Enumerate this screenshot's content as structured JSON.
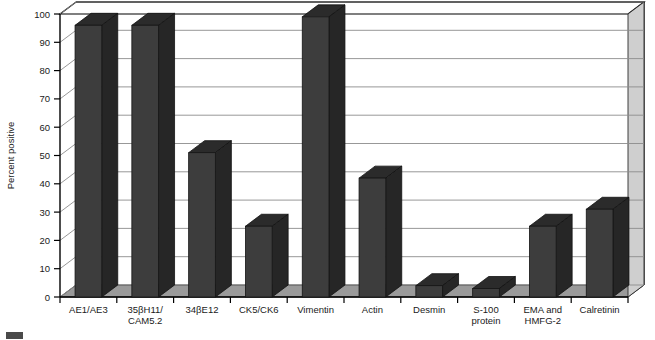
{
  "chart_data": {
    "type": "bar",
    "title": "",
    "xlabel": "",
    "ylabel": "Percent positive",
    "ylim": [
      0,
      100
    ],
    "yticks": [
      0,
      10,
      20,
      30,
      40,
      50,
      60,
      70,
      80,
      90,
      100
    ],
    "grid": true,
    "legend": "none",
    "three_d": true,
    "categories": [
      "AE1/AE3",
      "35βH11/ CAM5.2",
      "34βE12",
      "CK5/CK6",
      "Vimentin",
      "Actin",
      "Desmin",
      "S-100 protein",
      "EMA and HMFG-2",
      "Calretinin"
    ],
    "category_lines": [
      [
        "AE1/AE3"
      ],
      [
        "35βH11/",
        "CAM5.2"
      ],
      [
        "34βE12"
      ],
      [
        "CK5/CK6"
      ],
      [
        "Vimentin"
      ],
      [
        "Actin"
      ],
      [
        "Desmin"
      ],
      [
        "S-100",
        "protein"
      ],
      [
        "EMA and",
        "HMFG-2"
      ],
      [
        "Calretinin"
      ]
    ],
    "values": [
      96,
      96,
      51,
      25,
      99,
      42,
      4,
      3,
      25,
      31
    ],
    "colors": {
      "bar_front": "#3d3d3d",
      "bar_top": "#2b2b2b",
      "bar_side": "#262626",
      "gridline": "#8c8c8c",
      "axis": "#000000",
      "floor": "#9a9a9a",
      "background": "#ffffff"
    }
  },
  "axis": {
    "y_title": "Percent positive",
    "tick_labels": [
      "0",
      "10",
      "20",
      "30",
      "40",
      "50",
      "60",
      "70",
      "80",
      "90",
      "100"
    ]
  }
}
